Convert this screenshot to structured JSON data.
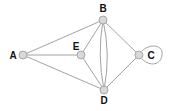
{
  "diagram": {
    "type": "graph",
    "nodes": [
      {
        "id": "A",
        "label": "A",
        "x": 23,
        "y": 55,
        "label_x": 13,
        "label_y": 59
      },
      {
        "id": "B",
        "label": "B",
        "x": 103,
        "y": 20,
        "label_x": 103,
        "label_y": 12
      },
      {
        "id": "C",
        "label": "C",
        "x": 139,
        "y": 55,
        "label_x": 150,
        "label_y": 59
      },
      {
        "id": "D",
        "label": "D",
        "x": 104,
        "y": 90,
        "label_x": 104,
        "label_y": 103
      },
      {
        "id": "E",
        "label": "E",
        "x": 81,
        "y": 55,
        "label_x": 76,
        "label_y": 50
      }
    ],
    "edges": [
      {
        "from": "A",
        "to": "B"
      },
      {
        "from": "A",
        "to": "E"
      },
      {
        "from": "A",
        "to": "D"
      },
      {
        "from": "E",
        "to": "B"
      },
      {
        "from": "E",
        "to": "D"
      },
      {
        "from": "B",
        "to": "D",
        "curve": "left"
      },
      {
        "from": "B",
        "to": "D",
        "curve": "right"
      },
      {
        "from": "B",
        "to": "C"
      },
      {
        "from": "D",
        "to": "C"
      },
      {
        "from": "C",
        "to": "C",
        "loop": true
      }
    ]
  }
}
